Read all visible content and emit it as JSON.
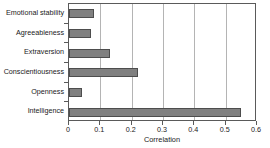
{
  "chart_data": {
    "type": "bar",
    "orientation": "horizontal",
    "title": "",
    "xlabel": "Correlation",
    "ylabel": "",
    "categories": [
      "Emotional stability",
      "Agreeableness",
      "Extraversion",
      "Conscientiousness",
      "Openness",
      "Intelligence"
    ],
    "values": [
      0.08,
      0.07,
      0.13,
      0.22,
      0.04,
      0.55
    ],
    "xlim": [
      0,
      0.6
    ],
    "xticks": [
      0,
      0.1,
      0.2,
      0.3,
      0.4,
      0.5,
      0.6
    ],
    "xticklabels": [
      "0",
      "0.1",
      "0.2",
      "0.3",
      "0.4",
      "0.5",
      "0.6"
    ],
    "grid": "vertical",
    "legend": null,
    "bar_color": "#808080",
    "bar_edge_color": "#4d4d4d",
    "grid_color": "#b4b4b4",
    "axis_color": "#5a5a5a",
    "background": "#ffffff"
  }
}
